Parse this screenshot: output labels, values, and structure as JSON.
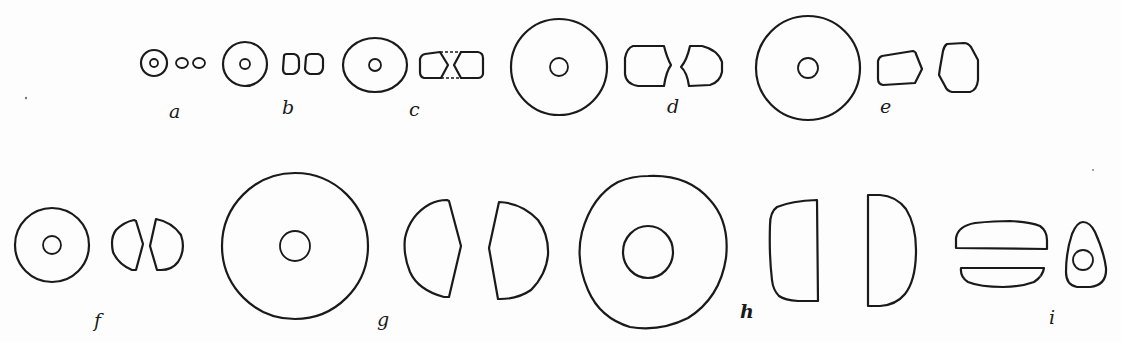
{
  "figure": {
    "background": "#fdfdfd",
    "ink_color": "#1a1a1a",
    "labels": [
      "a",
      "b",
      "c",
      "d",
      "e",
      "f",
      "g",
      "h",
      "i"
    ]
  },
  "items": [
    {
      "id": "a",
      "label": "a",
      "label_pos": [
        174,
        118
      ],
      "face": {
        "type": "circle",
        "cx": 154,
        "cy": 63,
        "r": 13,
        "hole_r": 4
      },
      "profiles": [
        {
          "type": "ellipse",
          "cx": 182,
          "cy": 63,
          "rx": 6,
          "ry": 5
        },
        {
          "type": "ellipse",
          "cx": 199,
          "cy": 63,
          "rx": 6,
          "ry": 5
        }
      ]
    },
    {
      "id": "b",
      "label": "b",
      "label_pos": [
        287,
        114
      ],
      "face": {
        "type": "circle",
        "cx": 245,
        "cy": 64,
        "r": 22,
        "hole_r": 5
      },
      "profiles": [
        {
          "type": "path",
          "d": "M284,56 Q284,54 287,54 L294,54 Q299,55 299,61 L299,68 Q298,73 293,74 L286,74 Q283,73 283,69 Z"
        },
        {
          "type": "path",
          "d": "M306,57 Q307,54 311,54 L318,54 Q322,55 323,59 L323,68 Q322,74 317,74 L310,74 Q306,73 305,69 Z"
        }
      ]
    },
    {
      "id": "c",
      "label": "c",
      "label_pos": [
        413,
        116
      ],
      "face": {
        "type": "ellipse",
        "cx": 375,
        "cy": 65,
        "rx": 32,
        "ry": 27,
        "hole_r": 6
      },
      "profiles": [
        {
          "type": "path",
          "d": "M425,54 L440,52 L448,65 L441,78 L424,78 Q420,77 420,72 L420,59 Q421,55 425,54 Z"
        },
        {
          "type": "path",
          "d": "M461,52 L478,52 Q483,53 483,58 L483,74 Q482,78 478,78 L461,78 L454,65 Z"
        },
        {
          "type": "dash",
          "d": "M440,52 L461,52 M441,78 L461,78"
        }
      ]
    },
    {
      "id": "d",
      "label": "d",
      "label_pos": [
        673,
        113
      ],
      "face": {
        "type": "circle",
        "cx": 559,
        "cy": 67,
        "r": 48,
        "hole_r": 9
      },
      "profiles": [
        {
          "type": "path",
          "d": "M633,46 L664,46 Q667,58 671,65 Q666,72 664,86 L638,86 Q626,84 625,74 L625,58 Q627,48 633,46 Z"
        },
        {
          "type": "path",
          "d": "M690,46 L702,46 Q718,50 722,62 L722,72 Q720,82 710,85 L689,86 Q687,72 681,67 Q687,60 690,46 Z"
        }
      ]
    },
    {
      "id": "e",
      "label": "e",
      "label_pos": [
        884,
        113
      ],
      "face": {
        "type": "circle",
        "cx": 808,
        "cy": 68,
        "r": 52,
        "hole_r": 10
      },
      "profiles": [
        {
          "type": "path",
          "d": "M882,56 L913,51 Q916,52 916,54 L922,69 L915,83 L883,85 Q878,84 878,79 L878,61 Q879,57 882,56 Z"
        },
        {
          "type": "path",
          "d": "M947,44 L964,43 Q968,43 971,47 L978,60 L978,80 Q977,90 970,92 L952,92 Q947,91 945,86 L939,75 L940,68 L943,51 Q944,46 947,44 Z"
        }
      ]
    },
    {
      "id": "f",
      "label": "f",
      "label_pos": [
        98,
        327
      ],
      "face": {
        "type": "circle",
        "cx": 52,
        "cy": 245,
        "r": 37,
        "hole_r": 9
      },
      "profiles": [
        {
          "type": "path",
          "d": "M134,220 L136,221 L143,244 L136,270 L132,270 Q118,264 113,252 Q110,238 116,230 Q124,222 134,220 Z"
        },
        {
          "type": "path",
          "d": "M156,219 Q172,222 181,235 Q186,250 178,262 Q172,270 161,270 L157,270 L150,246 Z"
        }
      ]
    },
    {
      "id": "g",
      "label": "g",
      "label_pos": [
        382,
        326
      ],
      "face": {
        "type": "circle",
        "cx": 295,
        "cy": 246,
        "r": 73,
        "hole_r": 15
      },
      "profiles": [
        {
          "type": "path",
          "d": "M447,200 L449,201 L461,246 L449,297 L444,297 Q418,290 410,272 Q403,255 405,238 Q410,215 430,204 Q438,200 447,200 Z"
        },
        {
          "type": "path",
          "d": "M499,202 Q522,203 538,220 Q549,235 548,255 Q546,275 531,290 Q518,299 500,299 L498,299 L489,248 Z"
        }
      ]
    },
    {
      "id": "h",
      "label": "h",
      "label_pos": [
        745,
        318
      ],
      "face": {
        "type": "blob",
        "d": "M648,176 Q688,174 710,200 Q730,222 726,258 Q720,298 688,318 Q660,332 630,327 Q600,318 588,290 Q575,260 582,232 Q592,196 618,182 Q632,176 648,176 Z",
        "hole": {
          "cx": 648,
          "cy": 252,
          "rx": 25,
          "ry": 26
        }
      },
      "profiles": [
        {
          "type": "path",
          "d": "M817,200 L818,301 L798,301 Q785,300 779,296 Q773,290 772,280 Q769,255 770,225 Q770,212 777,207 Q791,201 817,200 Z"
        },
        {
          "type": "path",
          "d": "M868,195 L880,195 Q896,196 906,209 Q916,225 916,250 Q916,280 905,294 Q896,305 880,306 L868,306 Z"
        }
      ]
    },
    {
      "id": "i",
      "label": "i",
      "label_pos": [
        1052,
        324
      ],
      "profiles": [
        {
          "type": "path",
          "d": "M956,248 L956,238 Q958,226 975,223 Q995,221 1010,221 Q1030,222 1040,226 Q1047,231 1047,240 L1047,249 Z"
        },
        {
          "type": "path",
          "d": "M961,268 L1044,268 Q1043,276 1034,282 Q1020,287 1003,287 Q980,287 968,282 Q960,277 961,268 Z"
        }
      ],
      "face": {
        "type": "teardrop",
        "d": "M1083,222 Q1090,222 1095,232 Q1104,252 1106,268 Q1107,285 1090,287 L1077,287 Q1066,285 1066,272 Q1066,252 1072,234 Q1077,222 1083,222 Z",
        "hole": {
          "cx": 1083,
          "cy": 260,
          "r": 10
        }
      }
    }
  ],
  "specks": [
    {
      "cx": 26,
      "cy": 98,
      "r": 1.2
    },
    {
      "cx": 1093,
      "cy": 170,
      "r": 0.9
    },
    {
      "cx": 1040,
      "cy": 276,
      "r": 0.8
    }
  ]
}
